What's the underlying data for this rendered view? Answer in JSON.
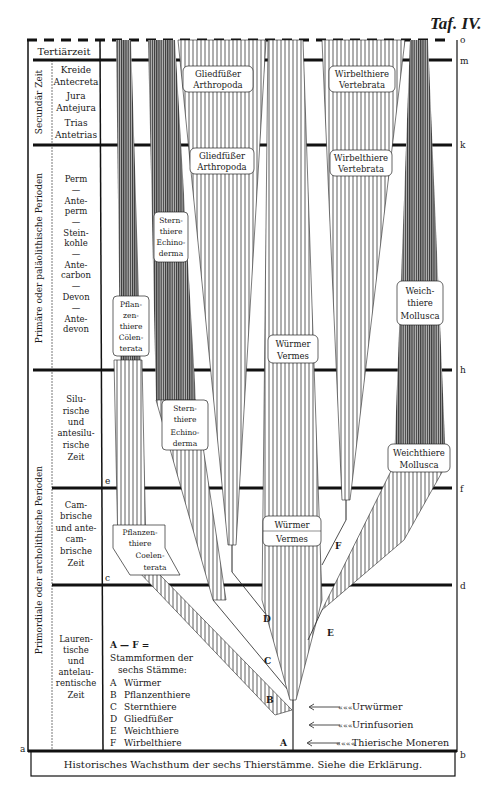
{
  "plate_title": "Taf. IV.",
  "caption": "Historisches Wachsthum der sechs Thierstämme. Siehe die Erklärung.",
  "boundary_letters": {
    "o": "o",
    "m": "m",
    "k": "k",
    "h": "h",
    "f": "f",
    "d": "d",
    "b": "b",
    "a": "a",
    "c": "c",
    "e": "e"
  },
  "eras": {
    "tertiary": "Tertiärzeit",
    "secondary": "Secundär Zeit",
    "primary": "Primäre oder paläolithische Perioden",
    "primordial": "Primordiale oder archolithische Perioden"
  },
  "periods": {
    "secondary": [
      "Kreide",
      "Antecreta",
      "Jura",
      "Antejura",
      "Trias",
      "Antetrias"
    ],
    "primary": [
      "Perm",
      "—",
      "Ante-",
      "perm",
      "—",
      "Stein-",
      "kohle",
      "—",
      "Ante-",
      "carbon",
      "—",
      "Devon",
      "—",
      "Ante-",
      "devon"
    ],
    "silurian": [
      "Silu-",
      "rische",
      "und",
      "antesilu-",
      "rische",
      "Zeit"
    ],
    "cambrian": [
      "Cam-",
      "brische",
      "und ante-",
      "cam-",
      "brische",
      "Zeit"
    ],
    "laurentian": [
      "Lauren-",
      "tische",
      "und",
      "antelau-",
      "rentische",
      "Zeit"
    ]
  },
  "legend": {
    "title": "A — F =",
    "subtitle_1": "Stammformen der",
    "subtitle_2": "sechs Stämme:",
    "items": [
      {
        "key": "A",
        "label": "Würmer"
      },
      {
        "key": "B",
        "label": "Pflanzenthiere"
      },
      {
        "key": "C",
        "label": "Sternthiere"
      },
      {
        "key": "D",
        "label": "Gliedfüßer"
      },
      {
        "key": "E",
        "label": "Weichthiere"
      },
      {
        "key": "F",
        "label": "Wirbelthiere"
      }
    ]
  },
  "root_annotations": [
    {
      "label": "Urwürmer"
    },
    {
      "label": "Urinfusorien"
    },
    {
      "label": "Thierische Moneren"
    }
  ],
  "branch_points": {
    "A": "A",
    "B": "B",
    "C": "C",
    "D": "D",
    "E": "E",
    "F": "F"
  },
  "phyla_labels": {
    "arthropoda_top": [
      "Gliedfüßer",
      "Arthropoda"
    ],
    "arthropoda_mid": [
      "Gliedfüßer",
      "Arthropoda"
    ],
    "vertebrata_top": [
      "Wirbelthiere",
      "Vertebrata"
    ],
    "vertebrata_mid": [
      "Wirbelthiere",
      "Vertebrata"
    ],
    "echinoderma_upper": [
      "Stern-",
      "thiere",
      "Echino-",
      "derma"
    ],
    "echinoderma_lower": [
      "Stern-",
      "thiere",
      "Echino-",
      "derma"
    ],
    "coelenterata_upper": [
      "Pflan-",
      "zen-",
      "thiere",
      "Cölen-",
      "terata"
    ],
    "coelenterata_lower": [
      "Pflanzen-",
      "thiere",
      "Coelen-",
      "terata"
    ],
    "vermes_upper": [
      "Würmer",
      "Vermes"
    ],
    "vermes_lower": [
      "Würmer",
      "Vermes"
    ],
    "mollusca_upper": [
      "Weich-",
      "thiere",
      "Mollusca"
    ],
    "mollusca_lower": [
      "Weichthiere",
      "Mollusca"
    ]
  }
}
